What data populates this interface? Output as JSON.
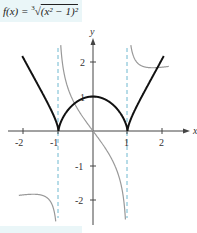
{
  "title": {
    "prefix": "f(x) = ",
    "root_index": "3",
    "radicand": "(x² − 1)²"
  },
  "chart_data": {
    "type": "line",
    "xlabel": "x",
    "ylabel": "y",
    "xlim": [
      -2.6,
      2.9
    ],
    "ylim": [
      -2.3,
      2.5
    ],
    "x_ticks": [
      "-2",
      "-1",
      "1",
      "2"
    ],
    "y_ticks": [
      "2",
      "1",
      "-1",
      "-2"
    ],
    "asymptotes": [
      -1,
      1
    ],
    "grid": false,
    "series": [
      {
        "name": "f(x) = (x²−1)^(2/3)",
        "color": "#111111",
        "x": [
          -2.0,
          -1.5,
          -1.0,
          -0.5,
          0,
          0.5,
          1.0,
          1.5,
          2.0
        ],
        "y": [
          2.08,
          1.16,
          0,
          0.83,
          1.0,
          0.83,
          0,
          1.16,
          2.08
        ]
      },
      {
        "name": "f'(x) = 4x / (3∛(x²−1))",
        "color": "#999999",
        "x": [
          -2.0,
          -1.5,
          -1.1,
          -0.9,
          -0.5,
          0,
          0.5,
          0.9,
          1.1,
          1.5,
          2.0
        ],
        "y": [
          -1.85,
          -1.85,
          -2.48,
          2.08,
          0.73,
          0,
          -0.73,
          -2.08,
          2.48,
          1.85,
          1.85
        ]
      }
    ]
  },
  "colors": {
    "curve": "#111111",
    "derivative": "#999999",
    "asymptote": "#6fb8d0",
    "axis": "#444444",
    "highlight": "#eaf6f8"
  }
}
